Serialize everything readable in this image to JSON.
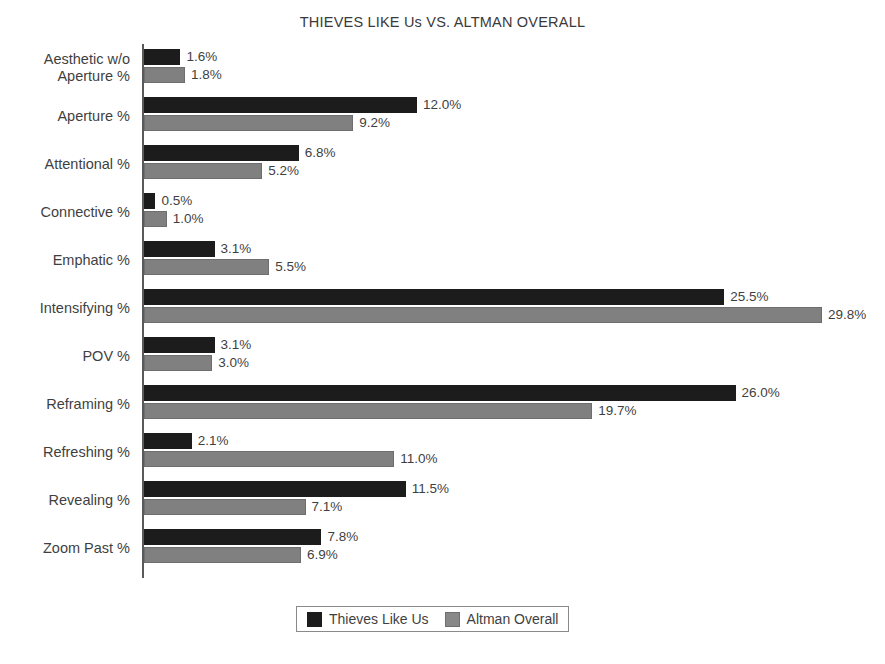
{
  "chart_data": {
    "type": "bar",
    "orientation": "horizontal",
    "title": "THIEVES LIKE Us VS. ALTMAN OVERALL",
    "xlabel": "",
    "ylabel": "",
    "grid": false,
    "legend_position": "bottom",
    "xlim": [
      0,
      32.5
    ],
    "categories": [
      "Aesthetic w/o\nAperture %",
      "Aperture %",
      "Attentional %",
      "Connective %",
      "Emphatic %",
      "Intensifying %",
      "POV %",
      "Reframing %",
      "Refreshing %",
      "Revealing %",
      "Zoom Past %"
    ],
    "series": [
      {
        "name": "Thieves Like Us",
        "color": "#1c1c1c",
        "values": [
          1.6,
          12.0,
          6.8,
          0.5,
          3.1,
          25.5,
          3.1,
          26.0,
          2.1,
          11.5,
          7.8
        ],
        "labels": [
          "1.6%",
          "12.0%",
          "6.8%",
          "0.5%",
          "3.1%",
          "25.5%",
          "3.1%",
          "26.0%",
          "2.1%",
          "11.5%",
          "7.8%"
        ]
      },
      {
        "name": "Altman Overall",
        "color": "#808080",
        "values": [
          1.8,
          9.2,
          5.2,
          1.0,
          5.5,
          29.8,
          3.0,
          19.7,
          11.0,
          7.1,
          6.9
        ],
        "labels": [
          "1.8%",
          "9.2%",
          "5.2%",
          "1.0%",
          "5.5%",
          "29.8%",
          "3.0%",
          "19.7%",
          "11.0%",
          "7.1%",
          "6.9%"
        ]
      }
    ]
  },
  "legend": {
    "entries": [
      {
        "label": "Thieves Like Us",
        "color": "#1c1c1c"
      },
      {
        "label": "Altman Overall",
        "color": "#888888"
      }
    ]
  }
}
